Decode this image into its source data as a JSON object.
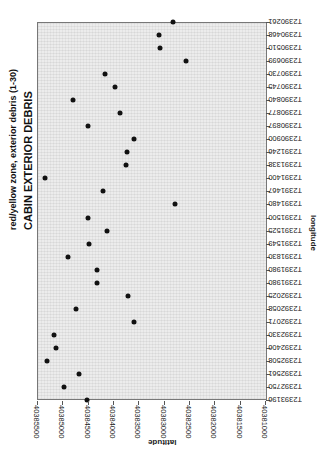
{
  "chart_data": {
    "type": "scatter",
    "title": "CABIN EXTERIOR DEBRIS",
    "subtitle": "red/yellow zone, exterior debris (1-30)",
    "xlabel": "longitude",
    "ylabel": "latitude",
    "orientation_note": "figure rotated 90 degrees; categories run along the vertical edge",
    "categories": [
      "T2390261",
      "T2390468",
      "T2390510",
      "T2390699",
      "T2390730",
      "T2390745",
      "T2390840",
      "T2390877",
      "T2390897",
      "T2390900",
      "T2391246",
      "T2391338",
      "T2391400",
      "T2391467",
      "T2391480",
      "T2391500",
      "T2391525",
      "T2391549",
      "T2391830",
      "T2391980",
      "T2391980",
      "T2392025",
      "T2392058",
      "T2392071",
      "T2392330",
      "T2392406",
      "T2392508",
      "T2392561",
      "T2392750",
      "T2393196"
    ],
    "values": [
      40382810,
      40383100,
      40383080,
      40382550,
      40384150,
      40383960,
      40384790,
      40383860,
      40384490,
      40383580,
      40383720,
      40383740,
      40385340,
      40384190,
      40382770,
      40384490,
      40384110,
      40384470,
      40384890,
      40384310,
      40384310,
      40383700,
      40384730,
      40383580,
      40385160,
      40385120,
      40385300,
      40384670,
      40384970,
      40384510
    ],
    "ylim": [
      40381000,
      40385500
    ],
    "yticks": [
      40385500,
      40385000,
      40384500,
      40384000,
      40383500,
      40383000,
      40382500,
      40382000,
      40381500,
      40381000
    ],
    "grid": true,
    "legend": "none"
  },
  "labels": {
    "title": "CABIN EXTERIOR DEBRIS",
    "subtitle": "red/yellow zone, exterior debris (1-30)",
    "xlabel": "longitude",
    "ylabel": "latitude"
  }
}
